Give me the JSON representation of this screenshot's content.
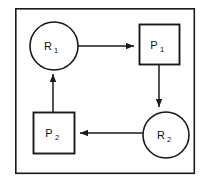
{
  "diagram": {
    "frame": {
      "name": "outer-frame",
      "x": 15,
      "y": 8,
      "width": 180,
      "height": 166,
      "stroke": "#1a1a1a",
      "fill": "#ffffff",
      "stroke_width": 1.6
    },
    "colors": {
      "stroke": "#1a1a1a",
      "node_fill": "#ffffff",
      "background": "#ffffff",
      "text": "#111111"
    },
    "nodes": [
      {
        "id": "r1",
        "shape": "circle",
        "label": "R",
        "subscript": "1",
        "full_label": "R1",
        "role": "resource",
        "cx": 54,
        "cy": 46,
        "r": 24,
        "stroke_width": 1.6
      },
      {
        "id": "p1",
        "shape": "square",
        "label": "P",
        "subscript": "1",
        "full_label": "P1",
        "role": "process",
        "x": 139,
        "y": 24,
        "width": 41,
        "height": 41,
        "stroke_width": 1.9
      },
      {
        "id": "r2",
        "shape": "circle",
        "label": "R",
        "subscript": "2",
        "full_label": "R2",
        "role": "resource",
        "cx": 166,
        "cy": 135,
        "r": 23,
        "stroke_width": 1.6
      },
      {
        "id": "p2",
        "shape": "square",
        "label": "P",
        "subscript": "2",
        "full_label": "P2",
        "role": "process",
        "x": 33,
        "y": 112,
        "width": 42,
        "height": 42,
        "stroke_width": 1.9
      }
    ],
    "edges": [
      {
        "id": "r1-to-p1",
        "from": "r1",
        "to": "p1",
        "orientation": "horizontal",
        "direction": "right",
        "x1": 78,
        "y1": 46,
        "x2": 137,
        "y2": 46
      },
      {
        "id": "p1-to-r2",
        "from": "p1",
        "to": "r2",
        "orientation": "vertical",
        "direction": "down",
        "x1": 159,
        "y1": 65,
        "x2": 159,
        "y2": 110
      },
      {
        "id": "r2-to-p2",
        "from": "r2",
        "to": "p2",
        "orientation": "horizontal",
        "direction": "left",
        "x1": 143,
        "y1": 133,
        "x2": 77,
        "y2": 133
      },
      {
        "id": "p2-to-r1",
        "from": "p2",
        "to": "r1",
        "orientation": "vertical",
        "direction": "up",
        "x1": 53,
        "y1": 112,
        "x2": 53,
        "y2": 71
      }
    ]
  }
}
